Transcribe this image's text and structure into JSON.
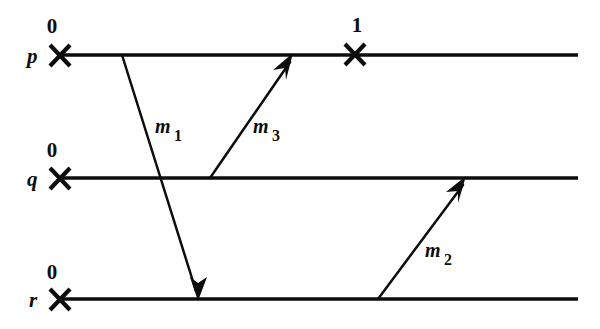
{
  "diagram": {
    "type": "lamport-space-time",
    "background_color": "#ffffff",
    "ink_color": "#0d0d0d",
    "width": 600,
    "height": 329,
    "processes": [
      {
        "id": "p",
        "label": "p",
        "line_y": 55,
        "line_x1": 60,
        "line_x2": 578,
        "events": [
          {
            "name": "p-event-0",
            "clock": "0",
            "x": 60,
            "label_y": 25
          },
          {
            "name": "p-event-1",
            "clock": "1",
            "x": 355,
            "label_y": 24
          }
        ]
      },
      {
        "id": "q",
        "label": "q",
        "line_y": 178,
        "line_x1": 60,
        "line_x2": 578,
        "events": [
          {
            "name": "q-event-0",
            "clock": "0",
            "x": 60,
            "label_y": 149
          }
        ]
      },
      {
        "id": "r",
        "label": "r",
        "line_y": 299,
        "line_x1": 60,
        "line_x2": 578,
        "events": [
          {
            "name": "r-event-0",
            "clock": "0",
            "x": 60,
            "label_y": 271
          }
        ]
      }
    ],
    "messages": [
      {
        "id": "m1",
        "label_m": "m",
        "label_sub": "1",
        "from_process": "p",
        "to_process": "r",
        "x1": 122,
        "y1": 55,
        "x2": 198,
        "y2": 299,
        "label_x": 158,
        "label_y": 133
      },
      {
        "id": "m3",
        "label_m": "m",
        "label_sub": "3",
        "from_process": "q",
        "to_process": "p",
        "x1": 210,
        "y1": 178,
        "x2": 292,
        "y2": 55,
        "label_x": 256,
        "label_y": 133
      },
      {
        "id": "m2",
        "label_m": "m",
        "label_sub": "2",
        "from_process": "r",
        "to_process": "q",
        "x1": 378,
        "y1": 299,
        "x2": 465,
        "y2": 178,
        "label_x": 428,
        "label_y": 257
      }
    ]
  }
}
